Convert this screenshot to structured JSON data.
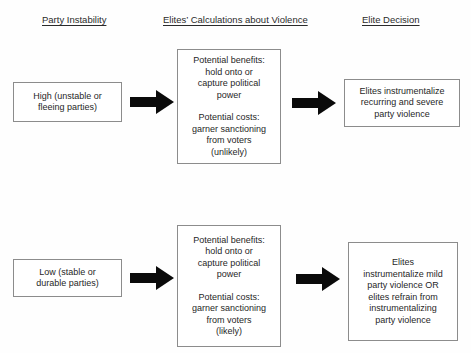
{
  "figure": {
    "background_color": "#fefefe",
    "box_border_color": "#8c8c8c",
    "arrow_color": "#0a0a0a",
    "text_color": "#1f1f1f"
  },
  "headers": {
    "party_instability": "Party Instability",
    "elites_calculations": "Elites’ Calculations about Violence",
    "elite_decision": "Elite Decision"
  },
  "rows": {
    "high": {
      "condition": {
        "line1": "High (unstable or",
        "line2": "fleeing parties)"
      },
      "calculations": {
        "benefits_label": "Potential benefits:",
        "benefits_line1": "hold onto or",
        "benefits_line2": "capture political",
        "benefits_line3": "power",
        "costs_label": "Potential costs:",
        "costs_line1": "garner sanctioning",
        "costs_line2": "from voters",
        "likelihood": "(unlikely)"
      },
      "outcome": {
        "line1": "Elites instrumentalize",
        "line2": "recurring and severe",
        "line3": "party violence"
      }
    },
    "low": {
      "condition": {
        "line1": "Low (stable or",
        "line2": "durable parties)"
      },
      "calculations": {
        "benefits_label": "Potential benefits:",
        "benefits_line1": "hold onto or",
        "benefits_line2": "capture political",
        "benefits_line3": "power",
        "costs_label": "Potential costs:",
        "costs_line1": "garner sanctioning",
        "costs_line2": "from voters",
        "likelihood": "(likely)"
      },
      "outcome": {
        "line1": "Elites",
        "line2": "instrumentalize mild",
        "line3": "party violence OR",
        "line4": "elites refrain from",
        "line5": "instrumentalizing",
        "line6": "party violence"
      }
    }
  },
  "arrows": {
    "high_to_calc": "right-arrow",
    "calc_to_outcome": "right-arrow",
    "low_to_calc": "right-arrow",
    "calclow_to_outcome": "right-arrow"
  }
}
